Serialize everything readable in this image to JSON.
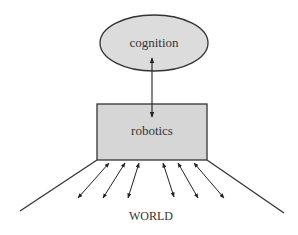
{
  "diagram": {
    "nodes": {
      "cognition": {
        "label": "cognition",
        "shape": "ellipse",
        "cx": 154,
        "cy": 43,
        "rx": 54,
        "ry": 28,
        "fill": "#dcdcdc",
        "stroke": "#333333"
      },
      "robotics": {
        "label": "robotics",
        "shape": "rectangle",
        "x": 97,
        "y": 104,
        "width": 110,
        "height": 56,
        "fill": "#d6d6d6",
        "stroke": "#333333"
      },
      "world": {
        "label": "WORLD",
        "x": 151,
        "y": 220
      }
    },
    "edges": [
      {
        "from": "cognition",
        "to": "robotics",
        "type": "bidirectional-arrow",
        "x1": 152,
        "y1": 58,
        "x2": 152,
        "y2": 117
      }
    ],
    "world_arrows": [
      {
        "x1": 109,
        "y1": 163,
        "x2": 78,
        "y2": 198
      },
      {
        "x1": 125,
        "y1": 163,
        "x2": 103,
        "y2": 198
      },
      {
        "x1": 139,
        "y1": 163,
        "x2": 128,
        "y2": 198
      },
      {
        "x1": 163,
        "y1": 163,
        "x2": 174,
        "y2": 197
      },
      {
        "x1": 178,
        "y1": 163,
        "x2": 198,
        "y2": 198
      },
      {
        "x1": 194,
        "y1": 163,
        "x2": 224,
        "y2": 198
      }
    ],
    "boundary_lines": [
      {
        "x1": 97,
        "y1": 160,
        "x2": 20,
        "y2": 211
      },
      {
        "x1": 207,
        "y1": 160,
        "x2": 284,
        "y2": 213
      }
    ],
    "colors": {
      "stroke": "#333333",
      "text": "#333333",
      "background": "#ffffff"
    }
  }
}
